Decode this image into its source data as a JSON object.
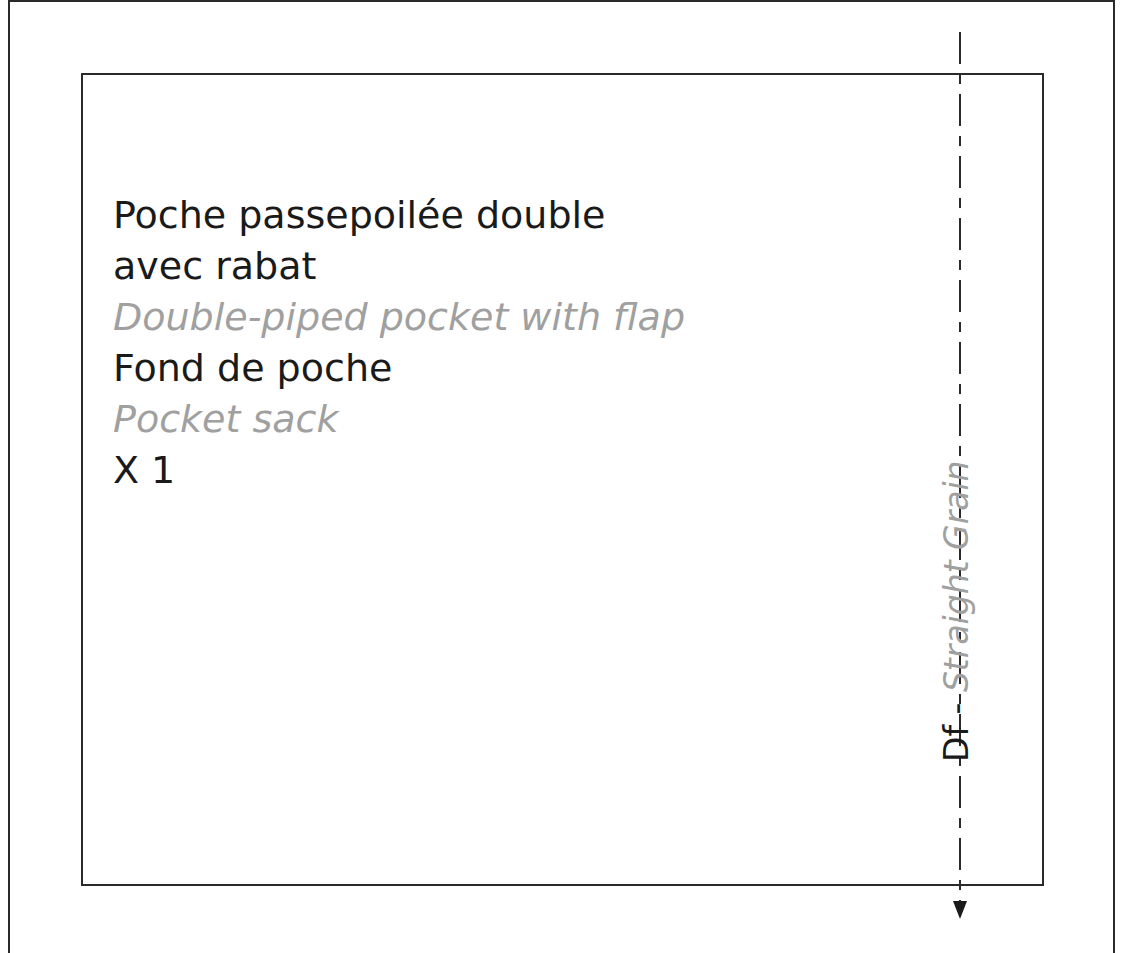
{
  "pattern_piece": {
    "lines": [
      {
        "text": "Poche passepoilée double",
        "lang": "fr"
      },
      {
        "text": "avec rabat",
        "lang": "fr"
      },
      {
        "text": "Double-piped pocket with flap",
        "lang": "en"
      },
      {
        "text": "Fond de poche",
        "lang": "fr"
      },
      {
        "text": "Pocket sack",
        "lang": "en"
      },
      {
        "text": "X 1",
        "lang": "fr"
      }
    ],
    "grainline": {
      "code": "Df",
      "separator": " - ",
      "label": "Straight Grain",
      "direction": "down"
    }
  },
  "colors": {
    "line": "#2a2a2a",
    "primary_text": "#1a1a1a",
    "secondary_text": "#a0a0a0"
  }
}
